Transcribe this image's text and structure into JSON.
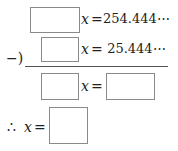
{
  "row1": {
    "variable": "x",
    "equals": "=",
    "value": "254.444⋯"
  },
  "row2": {
    "operator": "−)",
    "variable": "x",
    "equals": "=",
    "value": " 25.444⋯"
  },
  "row3": {
    "variable": "x",
    "equals": "="
  },
  "row4": {
    "therefore": "∴",
    "variable": "x",
    "equals": "="
  }
}
